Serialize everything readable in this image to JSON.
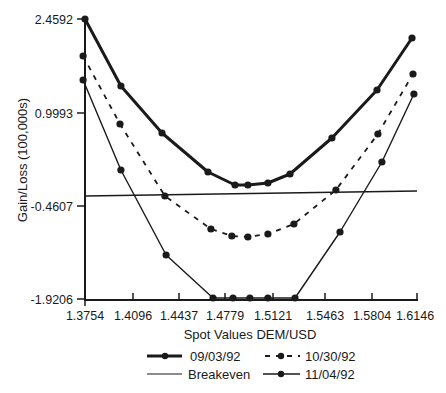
{
  "chart_data": {
    "type": "line",
    "title": "",
    "xlabel": "Spot Values DEM/USD",
    "ylabel": "Gain/Loss (100,000s)",
    "xlim": [
      1.3754,
      1.6146
    ],
    "ylim": [
      -1.9206,
      2.4592
    ],
    "x_ticks": [
      "1.3754",
      "1.4096",
      "1.4437",
      "1.4779",
      "1.5121",
      "1.5463",
      "1.5804",
      "1.6146"
    ],
    "y_ticks": [
      "2.4592",
      "0.9993",
      "-0.4607",
      "-1.9206"
    ],
    "grid": false,
    "legend_position": "bottom",
    "series": [
      {
        "name": "09/03/92",
        "style": "thick-solid-markers",
        "x": [
          1.3754,
          1.4013,
          1.4309,
          1.464,
          1.4835,
          1.4928,
          1.5072,
          1.5231,
          1.5533,
          1.5858,
          1.611
        ],
        "y": [
          2.4592,
          1.4075,
          0.6697,
          0.0575,
          -0.1466,
          -0.1466,
          -0.1152,
          0.0261,
          0.5912,
          1.3447,
          2.161
        ]
      },
      {
        "name": "10/30/92",
        "style": "dashed-markers",
        "x": [
          1.374,
          1.4006,
          1.433,
          1.4661,
          1.4812,
          1.4928,
          1.5072,
          1.5259,
          1.5562,
          1.5864,
          1.6117
        ],
        "y": [
          1.8784,
          0.811,
          -0.3193,
          -0.8373,
          -0.9472,
          -0.9629,
          -0.9158,
          -0.7588,
          -0.2251,
          0.654,
          1.5958
        ],
        "note": "left point slightly on axis"
      },
      {
        "name": "11/04/92",
        "style": "thin-solid-markers",
        "x": [
          1.374,
          1.4013,
          1.4338,
          1.4676,
          1.482,
          1.4942,
          1.5072,
          1.5267,
          1.5591,
          1.5893,
          1.6124
        ],
        "y": [
          1.5017,
          0.0889,
          -1.2454,
          -1.9206,
          -1.9206,
          -1.9206,
          -1.9206,
          -1.9206,
          -0.8845,
          0.2144,
          1.2818
        ]
      },
      {
        "name": "Breakeven",
        "style": "thin-solid-line",
        "x": [
          1.3754,
          1.6146
        ],
        "y": [
          -0.3193,
          -0.2408
        ]
      }
    ]
  },
  "axes": {
    "xlabel": "Spot Values DEM/USD",
    "ylabel": "Gain/Loss (100,000s)",
    "x_ticks": [
      "1.3754",
      "1.4096",
      "1.4437",
      "1.4779",
      "1.5121",
      "1.5463",
      "1.5804",
      "1.6146"
    ],
    "y_ticks": [
      "2.4592",
      "0.9993",
      "-0.4607",
      "-1.9206"
    ]
  },
  "legend": {
    "items": [
      {
        "label": "09/03/92",
        "style": "thick"
      },
      {
        "label": "10/30/92",
        "style": "dashed"
      },
      {
        "label": "Breakeven",
        "style": "thin-plain"
      },
      {
        "label": "11/04/92",
        "style": "thin-marker"
      }
    ]
  },
  "colors": {
    "ink": "#1a1a1a",
    "background": "#ffffff"
  }
}
